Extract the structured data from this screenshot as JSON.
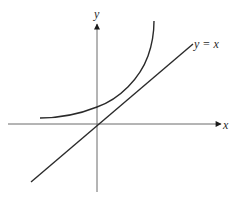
{
  "diagram": {
    "title": "",
    "axes": {
      "x_label": "x",
      "y_label": "y",
      "color": "#6b6b6b"
    },
    "line": {
      "label": "y = x",
      "color": "#2a2a2a"
    },
    "curve": {
      "label": "",
      "color": "#2a2a2a",
      "description": "exponential-like curve above y = x, approaching a horizontal asymptote on the left and rising steeply on the right"
    }
  }
}
